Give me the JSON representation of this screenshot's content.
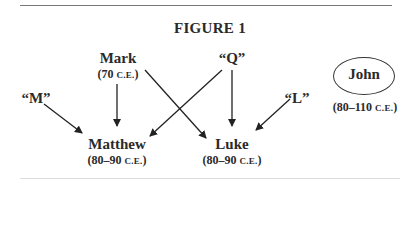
{
  "figure": {
    "title": "FIGURE 1",
    "nodes": {
      "mark": {
        "name": "Mark",
        "date_num": "(70 ",
        "date_era": "C.E.",
        "date_close": ")"
      },
      "q": {
        "name": "“Q”"
      },
      "m": {
        "name": "“M”"
      },
      "l": {
        "name": "“L”"
      },
      "matthew": {
        "name": "Matthew",
        "date_num": "(80–90 ",
        "date_era": "C.E.",
        "date_close": ")"
      },
      "luke": {
        "name": "Luke",
        "date_num": "(80–90 ",
        "date_era": "C.E.",
        "date_close": ")"
      },
      "john": {
        "name": "John",
        "date_num": "(80–110 ",
        "date_era": "C.E.",
        "date_close": ")"
      }
    },
    "edges": [
      {
        "from": "Mark",
        "to": "Matthew"
      },
      {
        "from": "Mark",
        "to": "Luke"
      },
      {
        "from": "Q",
        "to": "Matthew"
      },
      {
        "from": "Q",
        "to": "Luke"
      },
      {
        "from": "M",
        "to": "Matthew"
      },
      {
        "from": "L",
        "to": "Luke"
      }
    ]
  }
}
